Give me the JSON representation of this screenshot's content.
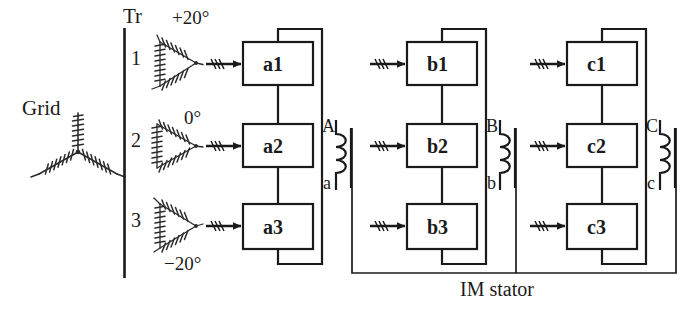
{
  "diagram": {
    "title_text": "IM stator",
    "grid": {
      "label": "Grid",
      "icon": "wye-winding-icon"
    },
    "transformer_section": {
      "label": "Tr",
      "divider_icon": "vertical-divider-line",
      "units": [
        {
          "number": "1",
          "angle": "+20°",
          "icon": "delta-winding-icon"
        },
        {
          "number": "2",
          "angle": "0°",
          "icon": "delta-winding-icon"
        },
        {
          "number": "3",
          "angle": "−20°",
          "icon": "delta-winding-icon"
        }
      ]
    },
    "feed_arrow_icon": "three-phase-arrow-icon",
    "columns": [
      {
        "name": "a",
        "boxes": [
          "a1",
          "a2",
          "a3"
        ],
        "coil": {
          "top_terminal": "A",
          "bottom_terminal": "a",
          "icon": "coil-winding-icon"
        }
      },
      {
        "name": "b",
        "boxes": [
          "b1",
          "b2",
          "b3"
        ],
        "coil": {
          "top_terminal": "B",
          "bottom_terminal": "b",
          "icon": "coil-winding-icon"
        }
      },
      {
        "name": "c",
        "boxes": [
          "c1",
          "c2",
          "c3"
        ],
        "coil": {
          "top_terminal": "C",
          "bottom_terminal": "c",
          "icon": "coil-winding-icon"
        }
      }
    ],
    "colors": {
      "line": "#1a1a1a",
      "text": "#1a1a1a",
      "background": "#ffffff"
    }
  }
}
